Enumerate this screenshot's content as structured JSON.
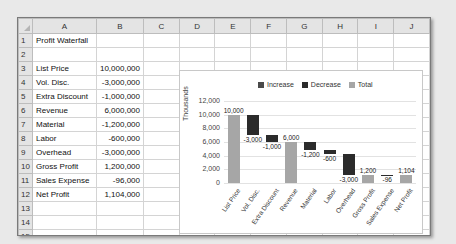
{
  "spreadsheet": {
    "columns": [
      "A",
      "B",
      "C",
      "D",
      "E",
      "F",
      "G",
      "H",
      "I",
      "J"
    ],
    "rows": [
      {
        "n": "1",
        "a": "Profit Waterfall",
        "b": ""
      },
      {
        "n": "2",
        "a": "",
        "b": ""
      },
      {
        "n": "3",
        "a": "List Price",
        "b": "10,000,000"
      },
      {
        "n": "4",
        "a": "Vol. Disc.",
        "b": "-3,000,000"
      },
      {
        "n": "5",
        "a": "Extra Discount",
        "b": "-1,000,000"
      },
      {
        "n": "6",
        "a": "Revenue",
        "b": "6,000,000"
      },
      {
        "n": "7",
        "a": "Material",
        "b": "-1,200,000"
      },
      {
        "n": "8",
        "a": "Labor",
        "b": "-600,000"
      },
      {
        "n": "9",
        "a": "Overhead",
        "b": "-3,000,000"
      },
      {
        "n": "10",
        "a": "Gross Profit",
        "b": "1,200,000"
      },
      {
        "n": "11",
        "a": "Sales Expense",
        "b": "-96,000"
      },
      {
        "n": "12",
        "a": "Net Profit",
        "b": "1,104,000"
      },
      {
        "n": "13",
        "a": "",
        "b": ""
      },
      {
        "n": "14",
        "a": "",
        "b": ""
      },
      {
        "n": "15",
        "a": "",
        "b": ""
      },
      {
        "n": "16",
        "a": "",
        "b": ""
      },
      {
        "n": "17",
        "a": "",
        "b": ""
      }
    ]
  },
  "colors": {
    "increase": "#4a4a4a",
    "decrease": "#2b2b2b",
    "total": "#a6a6a6"
  },
  "chart_data": {
    "type": "bar",
    "subtype": "waterfall",
    "title": "",
    "ylabel": "Thousands",
    "xlabel": "",
    "ylim": [
      0,
      12000
    ],
    "yticks": [
      "0",
      "2,000",
      "4,000",
      "6,000",
      "8,000",
      "10,000",
      "12,000"
    ],
    "grid": true,
    "legend": {
      "position": "top",
      "entries": [
        "Increase",
        "Decrease",
        "Total"
      ]
    },
    "categories": [
      "List Price",
      "Vol. Disc.",
      "Extra Discount",
      "Revenue",
      "Material",
      "Labor",
      "Overhead",
      "Gross Profit",
      "Sales Expense",
      "Net Profit"
    ],
    "values": [
      10000,
      -3000,
      -1000,
      6000,
      -1200,
      -600,
      -3000,
      1200,
      -96,
      1104
    ],
    "kinds": [
      "total",
      "decrease",
      "decrease",
      "total",
      "decrease",
      "decrease",
      "decrease",
      "total",
      "decrease",
      "total"
    ],
    "data_labels": [
      "10,000",
      "-3,000",
      "-1,000",
      "6,000",
      "-1,200",
      "-600",
      "-3,000",
      "1,200",
      "-96",
      "1,104"
    ]
  }
}
